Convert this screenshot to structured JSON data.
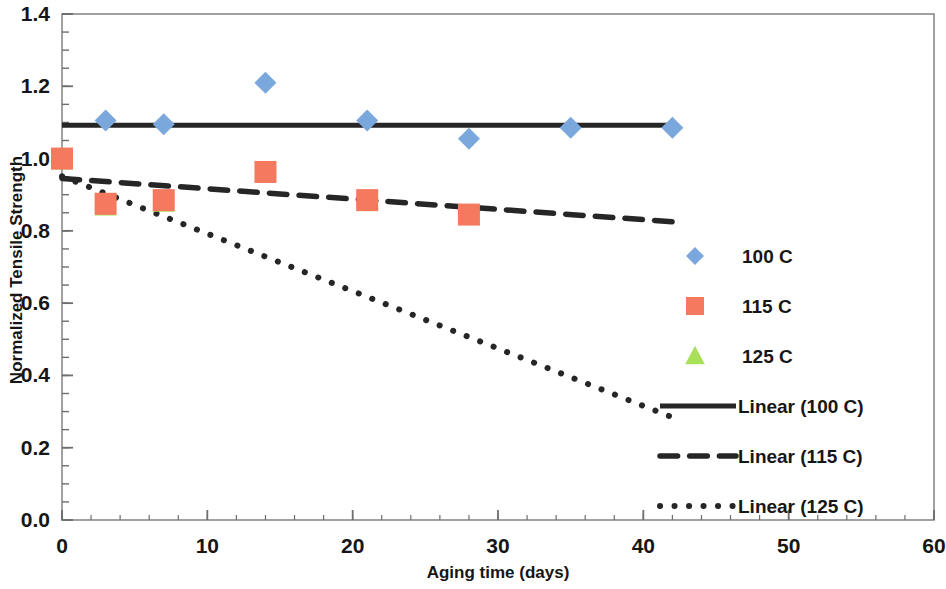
{
  "chart_data": {
    "type": "scatter",
    "title": "",
    "xlabel": "Aging time (days)",
    "ylabel": "Normalized Tensile Strength",
    "xlim": [
      0,
      60
    ],
    "ylim": [
      0.0,
      1.4
    ],
    "xticks": [
      "0",
      "10",
      "20",
      "30",
      "40",
      "50",
      "60"
    ],
    "xtick_values": [
      0,
      10,
      20,
      30,
      40,
      50,
      60
    ],
    "yticks": [
      "0.0",
      "0.2",
      "0.4",
      "0.6",
      "0.8",
      "1.0",
      "1.2",
      "1.4"
    ],
    "ytick_values": [
      0.0,
      0.2,
      0.4,
      0.6,
      0.8,
      1.0,
      1.2,
      1.4
    ],
    "x_minor_tick_step": 2,
    "y_minor_tick_step": 0.05,
    "grid": false,
    "legend_position": "right",
    "series": [
      {
        "name": "100 C",
        "marker": "diamond",
        "color": "#7aa8dd",
        "x": [
          3,
          7,
          14,
          21,
          28,
          35,
          42
        ],
        "y": [
          1.105,
          1.095,
          1.21,
          1.105,
          1.055,
          1.085,
          1.085
        ]
      },
      {
        "name": "115 C",
        "marker": "square",
        "color": "#f4795e",
        "x": [
          0,
          3,
          7,
          14,
          21,
          28
        ],
        "y": [
          1.0,
          0.875,
          0.885,
          0.963,
          0.885,
          0.845
        ]
      },
      {
        "name": "125 C",
        "marker": "triangle",
        "color": "#a9e05a",
        "x": [
          0,
          3,
          7
        ],
        "y": [
          0.995,
          0.868,
          0.878
        ]
      }
    ],
    "trendlines": [
      {
        "name": "Linear (100 C)",
        "style": "solid",
        "color": "#262626",
        "x": [
          0,
          42
        ],
        "y": [
          1.092,
          1.092
        ]
      },
      {
        "name": "Linear (115 C)",
        "style": "dashed",
        "color": "#262626",
        "x": [
          0,
          42.8
        ],
        "y": [
          0.945,
          0.823
        ]
      },
      {
        "name": "Linear (125 C)",
        "style": "dotted",
        "color": "#262626",
        "x": [
          0,
          42
        ],
        "y": [
          0.951,
          0.284
        ]
      }
    ],
    "legend": [
      {
        "label": "100 C",
        "kind": "marker",
        "marker": "diamond",
        "color": "#7aa8dd"
      },
      {
        "label": "115 C",
        "kind": "marker",
        "marker": "square",
        "color": "#f4795e"
      },
      {
        "label": "125 C",
        "kind": "marker",
        "marker": "triangle",
        "color": "#a9e05a"
      },
      {
        "label": "Linear (100 C)",
        "kind": "line",
        "style": "solid",
        "color": "#262626"
      },
      {
        "label": "Linear (115 C)",
        "kind": "line",
        "style": "dashed",
        "color": "#262626"
      },
      {
        "label": "Linear (125 C)",
        "kind": "line",
        "style": "dotted",
        "color": "#262626"
      }
    ]
  },
  "axis": {
    "x_title": "Aging time (days)",
    "y_title": "Normalized Tensile Strength",
    "xticks": [
      "0",
      "10",
      "20",
      "30",
      "40",
      "50",
      "60"
    ],
    "yticks": [
      "1.4",
      "1.2",
      "1.0",
      "0.8",
      "0.6",
      "0.4",
      "0.2",
      "0.0"
    ]
  },
  "legend": {
    "items": [
      {
        "label": "100 C"
      },
      {
        "label": "115 C"
      },
      {
        "label": "125 C"
      },
      {
        "label": "Linear (100 C)"
      },
      {
        "label": "Linear (115 C)"
      },
      {
        "label": "Linear (125 C)"
      }
    ]
  },
  "colors": {
    "series_100c": "#7aa8dd",
    "series_115c": "#f4795e",
    "series_125c": "#a9e05a",
    "trend": "#262626",
    "axis": "#6e6e6e",
    "text": "#161616",
    "background": "#ffffff"
  }
}
